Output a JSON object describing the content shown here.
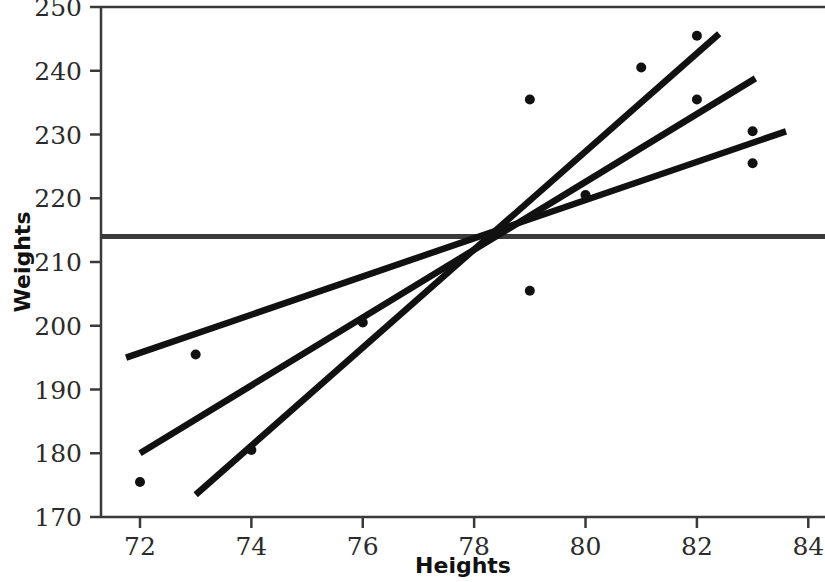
{
  "chart_data": {
    "type": "scatter",
    "title": "",
    "xlabel": "Heights",
    "ylabel": "Weights",
    "xlim": [
      71.3,
      84.3
    ],
    "ylim": [
      170,
      250
    ],
    "xticks": [
      72,
      74,
      76,
      78,
      80,
      82,
      84
    ],
    "xtick_labels": [
      "72",
      "74",
      "76",
      "78",
      "80",
      "82",
      "84"
    ],
    "yticks": [
      170,
      180,
      190,
      200,
      210,
      220,
      230,
      240,
      250
    ],
    "ytick_labels": [
      "170",
      "180",
      "190",
      "200",
      "210",
      "220",
      "230",
      "240",
      "250"
    ],
    "grid": false,
    "legend": "none",
    "point_color": "#111111",
    "line_color": "#111111",
    "mean_line_color": "#3a3a3a",
    "points": [
      {
        "x": 72,
        "y": 175.5
      },
      {
        "x": 73,
        "y": 195.5
      },
      {
        "x": 74,
        "y": 180.5
      },
      {
        "x": 76,
        "y": 200.5
      },
      {
        "x": 79,
        "y": 235.5
      },
      {
        "x": 79,
        "y": 205.5
      },
      {
        "x": 80,
        "y": 220.5
      },
      {
        "x": 81,
        "y": 240.5
      },
      {
        "x": 82,
        "y": 245.5
      },
      {
        "x": 82,
        "y": 235.5
      },
      {
        "x": 83,
        "y": 230.5
      },
      {
        "x": 83,
        "y": 225.5
      }
    ],
    "lines": [
      {
        "name": "shallow-fit-line",
        "x0": 71.75,
        "y0": 195.0,
        "x1": 83.6,
        "y1": 230.5
      },
      {
        "name": "medium-fit-line",
        "x0": 72.0,
        "y0": 180.0,
        "x1": 83.05,
        "y1": 238.8
      },
      {
        "name": "steep-fit-line",
        "x0": 73.0,
        "y0": 173.5,
        "x1": 82.4,
        "y1": 245.8
      }
    ],
    "mean_line": {
      "name": "mean-weight-line",
      "y": 214.0,
      "spans_full_width": true
    },
    "convergence_point": {
      "x": 78.4,
      "y": 214.0
    }
  }
}
